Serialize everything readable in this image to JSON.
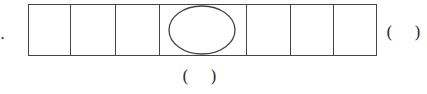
{
  "diagram": {
    "lead_mark": ".",
    "strip": {
      "cells": 7,
      "shape_in_middle_cell": "ellipse"
    },
    "right_blank": "(    )",
    "bottom_blank": "(    )"
  }
}
